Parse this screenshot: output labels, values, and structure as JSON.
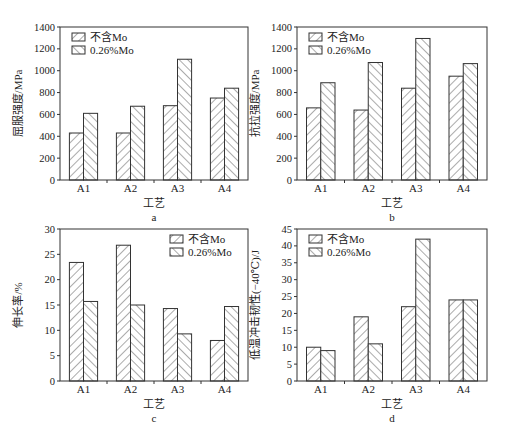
{
  "figure": {
    "legend": [
      "不含Mo",
      "0.26%Mo"
    ],
    "xlabel": "工艺",
    "colors": {
      "axis": "#333333",
      "bar_fill": "#ffffff",
      "hatch": "#444444",
      "background": "#ffffff"
    }
  },
  "chart_data": [
    {
      "type": "bar",
      "panel": "a",
      "title": "",
      "caption": "a",
      "categories": [
        "A1",
        "A2",
        "A3",
        "A4"
      ],
      "series": [
        {
          "name": "不含Mo",
          "values": [
            430,
            430,
            680,
            750
          ]
        },
        {
          "name": "0.26%Mo",
          "values": [
            610,
            675,
            1105,
            840
          ]
        }
      ],
      "xlabel": "工艺",
      "ylabel": "屈服强度/MPa",
      "ylim": [
        0,
        1400
      ],
      "yticks": [
        0,
        200,
        400,
        600,
        800,
        1000,
        1200,
        1400
      ],
      "grid": false,
      "legend_position": "upper left"
    },
    {
      "type": "bar",
      "panel": "b",
      "title": "",
      "caption": "b",
      "categories": [
        "A1",
        "A2",
        "A3",
        "A4"
      ],
      "series": [
        {
          "name": "不含Mo",
          "values": [
            660,
            640,
            840,
            950
          ]
        },
        {
          "name": "0.26%Mo",
          "values": [
            890,
            1075,
            1295,
            1065
          ]
        }
      ],
      "xlabel": "工艺",
      "ylabel": "抗拉强度/MPa",
      "ylim": [
        0,
        1400
      ],
      "yticks": [
        0,
        200,
        400,
        600,
        800,
        1000,
        1200,
        1400
      ],
      "grid": false,
      "legend_position": "upper left"
    },
    {
      "type": "bar",
      "panel": "c",
      "title": "",
      "caption": "c",
      "categories": [
        "A1",
        "A2",
        "A3",
        "A4"
      ],
      "series": [
        {
          "name": "不含Mo",
          "values": [
            23.4,
            26.8,
            14.3,
            8.0
          ]
        },
        {
          "name": "0.26%Mo",
          "values": [
            15.7,
            15.0,
            9.3,
            14.7
          ]
        }
      ],
      "xlabel": "工艺",
      "ylabel": "伸长率/%",
      "ylim": [
        0,
        30
      ],
      "yticks": [
        0,
        5,
        10,
        15,
        20,
        25,
        30
      ],
      "grid": false,
      "legend_position": "upper right"
    },
    {
      "type": "bar",
      "panel": "d",
      "title": "",
      "caption": "d",
      "categories": [
        "A1",
        "A2",
        "A3",
        "A4"
      ],
      "series": [
        {
          "name": "不含Mo",
          "values": [
            10,
            19,
            22,
            24
          ]
        },
        {
          "name": "0.26%Mo",
          "values": [
            9,
            11,
            42,
            24
          ]
        }
      ],
      "xlabel": "工艺",
      "ylabel": "低温冲击韧性(−40℃)/J",
      "ylim": [
        0,
        45
      ],
      "yticks": [
        0,
        5,
        10,
        15,
        20,
        25,
        30,
        35,
        40,
        45
      ],
      "grid": false,
      "legend_position": "upper left"
    }
  ]
}
